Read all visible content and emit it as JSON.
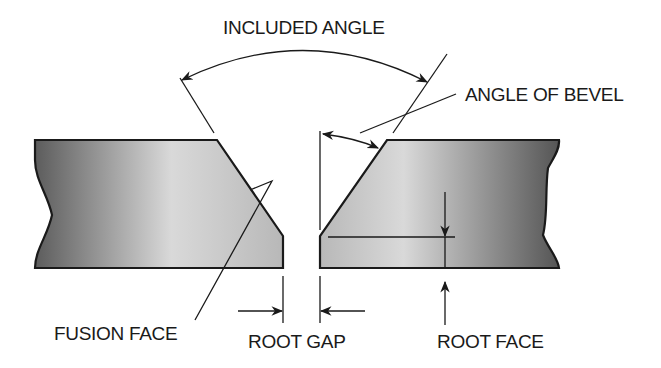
{
  "diagram": {
    "type": "weld joint preparation (single-V butt joint)",
    "labels": {
      "included_angle": "INCLUDED ANGLE",
      "angle_of_bevel": "ANGLE OF BEVEL",
      "fusion_face": "FUSION FACE",
      "root_gap": "ROOT GAP",
      "root_face": "ROOT FACE"
    },
    "colors": {
      "outline": "#1a1a1a",
      "plate_dark": "#5a5a5a",
      "plate_light": "#d8d8d8",
      "background": "#ffffff"
    }
  }
}
